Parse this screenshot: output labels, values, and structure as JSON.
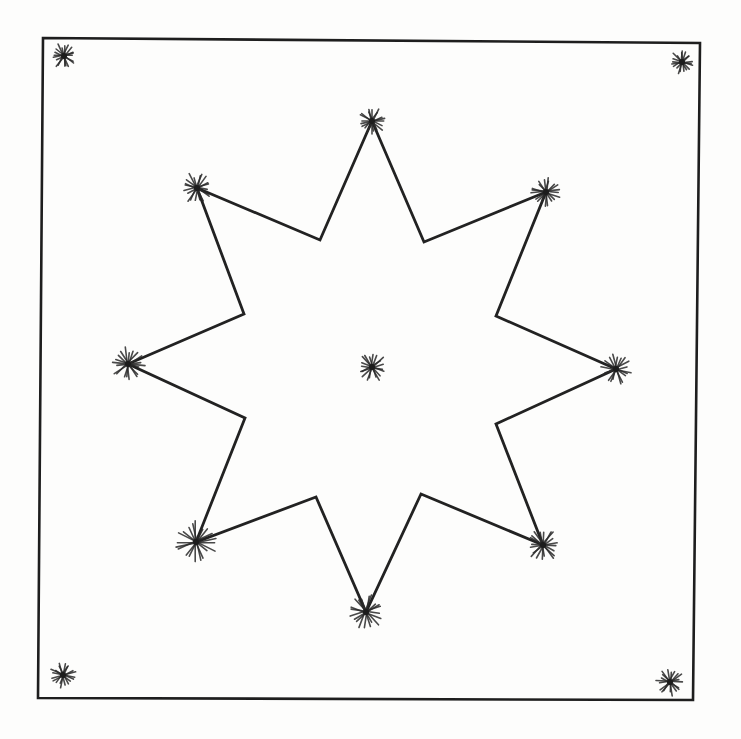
{
  "diagram": {
    "frame": {
      "corners": [
        [
          43,
          38
        ],
        [
          700,
          43
        ],
        [
          693,
          700
        ],
        [
          38,
          698
        ]
      ],
      "stroke_color": "#1e1e1e"
    },
    "star": {
      "stroke_color": "#222222",
      "vertices": [
        [
          372,
          121
        ],
        [
          424,
          242
        ],
        [
          546,
          192
        ],
        [
          496,
          316
        ],
        [
          616,
          369
        ],
        [
          496,
          424
        ],
        [
          543,
          545
        ],
        [
          421,
          494
        ],
        [
          366,
          612
        ],
        [
          316,
          497
        ],
        [
          196,
          542
        ],
        [
          245,
          418
        ],
        [
          128,
          364
        ],
        [
          244,
          314
        ],
        [
          197,
          188
        ],
        [
          320,
          240
        ]
      ]
    },
    "asterisks": [
      {
        "name": "corner-top-left",
        "x": 64,
        "y": 56,
        "r": 12
      },
      {
        "name": "corner-top-right",
        "x": 682,
        "y": 62,
        "r": 11
      },
      {
        "name": "corner-bottom-left",
        "x": 63,
        "y": 675,
        "r": 12
      },
      {
        "name": "corner-bottom-right",
        "x": 670,
        "y": 682,
        "r": 13
      },
      {
        "name": "center",
        "x": 372,
        "y": 367,
        "r": 14
      },
      {
        "name": "star-point-top",
        "x": 372,
        "y": 121,
        "r": 13
      },
      {
        "name": "star-point-upper-right",
        "x": 546,
        "y": 192,
        "r": 14
      },
      {
        "name": "star-point-right",
        "x": 616,
        "y": 369,
        "r": 15
      },
      {
        "name": "star-point-lower-right",
        "x": 543,
        "y": 545,
        "r": 16
      },
      {
        "name": "star-point-bottom",
        "x": 366,
        "y": 612,
        "r": 17
      },
      {
        "name": "star-point-lower-left",
        "x": 196,
        "y": 542,
        "r": 20
      },
      {
        "name": "star-point-left",
        "x": 128,
        "y": 364,
        "r": 16
      },
      {
        "name": "star-point-upper-left",
        "x": 197,
        "y": 188,
        "r": 15
      }
    ]
  }
}
